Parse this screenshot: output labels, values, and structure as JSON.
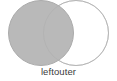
{
  "figure": {
    "caption": "leftouter",
    "width": 117,
    "height": 81,
    "background_color": "#ffffff",
    "caption_color": "#3b3b3b"
  },
  "chart_data": {
    "type": "diagram",
    "diagram_type": "venn",
    "title": "leftouter",
    "set_count": 2,
    "sets": [
      {
        "name": "left",
        "position": "left",
        "cx": 41,
        "cy": 33,
        "r": 32.5,
        "fill": "#b9b9b9",
        "stroke": "#a6a6a6",
        "selected": true
      },
      {
        "name": "right",
        "position": "right",
        "cx": 76,
        "cy": 33,
        "r": 32.5,
        "fill": "#ffffff",
        "stroke": "#c9c9c9",
        "selected": false
      }
    ],
    "regions": [
      {
        "name": "left-only",
        "shaded": true,
        "fill": "#b9b9b9"
      },
      {
        "name": "intersection",
        "shaded": true,
        "fill": "#b9b9b9"
      },
      {
        "name": "right-only",
        "shaded": false,
        "fill": "#ffffff"
      }
    ],
    "legend": [],
    "annotations": [
      "leftouter"
    ]
  }
}
